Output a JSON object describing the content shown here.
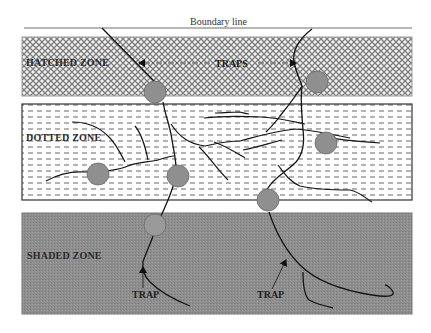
{
  "diagram": {
    "boundary_label": "Boundary line",
    "zones": [
      {
        "name": "hatched",
        "label": "HATCHED ZONE",
        "fill_pattern": "crosshatch",
        "color": "#b8b8b8"
      },
      {
        "name": "dotted",
        "label": "DOTTED ZONE",
        "fill_pattern": "dashes",
        "color": "#ffffff"
      },
      {
        "name": "shaded",
        "label": "SHADED ZONE",
        "fill_pattern": "solid",
        "color": "#8c8c8c"
      }
    ],
    "annotations": {
      "traps_label": "TRAPS",
      "trap_left_label": "TRAP",
      "trap_right_label": "TRAP"
    },
    "trap_color": "#8f8f8f",
    "line_color": "#1a1a1a"
  }
}
